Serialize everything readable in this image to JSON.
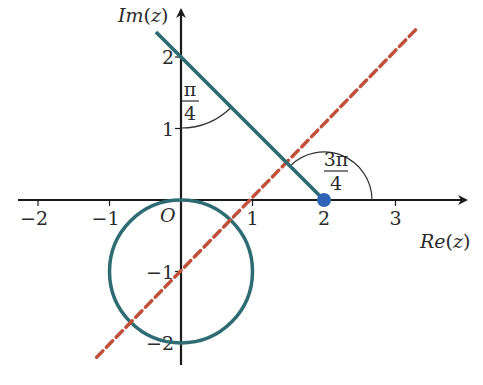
{
  "figure": {
    "type": "argand-diagram",
    "axes": {
      "x_label": "Re(z)",
      "y_label": "Im(z)",
      "origin_label": "O",
      "x_range": [
        -2.5,
        4
      ],
      "y_range": [
        -2.4,
        2.6
      ],
      "x_ticks": [
        {
          "value": -2,
          "label": "−2"
        },
        {
          "value": -1,
          "label": "−1"
        },
        {
          "value": 1,
          "label": "1"
        },
        {
          "value": 2,
          "label": "2"
        },
        {
          "value": 3,
          "label": "3"
        }
      ],
      "y_ticks": [
        {
          "value": 2,
          "label": "2"
        },
        {
          "value": 1,
          "label": "1"
        },
        {
          "value": -1,
          "label": "−1"
        },
        {
          "value": -2,
          "label": "−2"
        }
      ]
    },
    "circle": {
      "center": [
        0,
        -1
      ],
      "radius": 1,
      "color": "#2e6b73"
    },
    "half_line": {
      "from": [
        2,
        0
      ],
      "to": [
        -0.35,
        2.35
      ],
      "arg": "3π/4",
      "color": "#2e6b73"
    },
    "dashed_line": {
      "equation": "y = x - 1",
      "from": [
        -1.18,
        -2.2
      ],
      "to": [
        3.3,
        2.4
      ],
      "color": "#c0503a"
    },
    "point": {
      "at": [
        2,
        0
      ],
      "color": "#2f64b4"
    },
    "angles": [
      {
        "id": "pi-over-4",
        "numerator": "π",
        "denominator": "4",
        "vertex": [
          0,
          2
        ]
      },
      {
        "id": "three-pi-over-4",
        "numerator": "3π",
        "denominator": "4",
        "vertex": [
          2,
          0
        ]
      }
    ]
  }
}
